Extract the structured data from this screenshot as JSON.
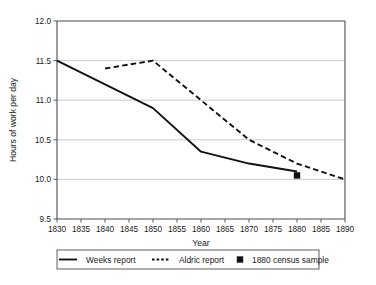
{
  "chart_data": {
    "type": "line",
    "title": "",
    "xlabel": "Year",
    "ylabel": "Hours of work per day",
    "xlim": [
      1830,
      1890
    ],
    "ylim": [
      9.5,
      12.0
    ],
    "grid": true,
    "legend_position": "below",
    "xticks": [
      1830,
      1835,
      1840,
      1845,
      1850,
      1855,
      1860,
      1865,
      1870,
      1875,
      1880,
      1885,
      1890
    ],
    "xtick_labels": [
      "1830",
      "1835",
      "1840",
      "1845",
      "1850",
      "1855",
      "1860",
      "1865",
      "1870",
      "1875",
      "1880",
      "1885",
      "1890"
    ],
    "yticks": [
      9.5,
      10.0,
      10.5,
      11.0,
      11.5,
      12.0
    ],
    "ytick_labels": [
      "9.5",
      "10.0",
      "10.5",
      "11.0",
      "11.5",
      "12.0"
    ],
    "series": [
      {
        "name": "Weeks report",
        "style": "solid",
        "x": [
          1830,
          1850,
          1860,
          1870,
          1880
        ],
        "values": [
          11.5,
          10.9,
          10.35,
          10.2,
          10.1
        ]
      },
      {
        "name": "Aldric report",
        "style": "dashed",
        "x": [
          1840,
          1850,
          1870,
          1880,
          1890
        ],
        "values": [
          11.4,
          11.5,
          10.5,
          10.2,
          10.0
        ]
      },
      {
        "name": "1880 census sample",
        "style": "marker-square",
        "x": [
          1880
        ],
        "values": [
          10.05
        ]
      }
    ],
    "legend_entries": [
      {
        "label": "Weeks report",
        "style": "solid"
      },
      {
        "label": "Aldric report",
        "style": "dashed"
      },
      {
        "label": "1880 census sample",
        "style": "marker-square"
      }
    ]
  }
}
